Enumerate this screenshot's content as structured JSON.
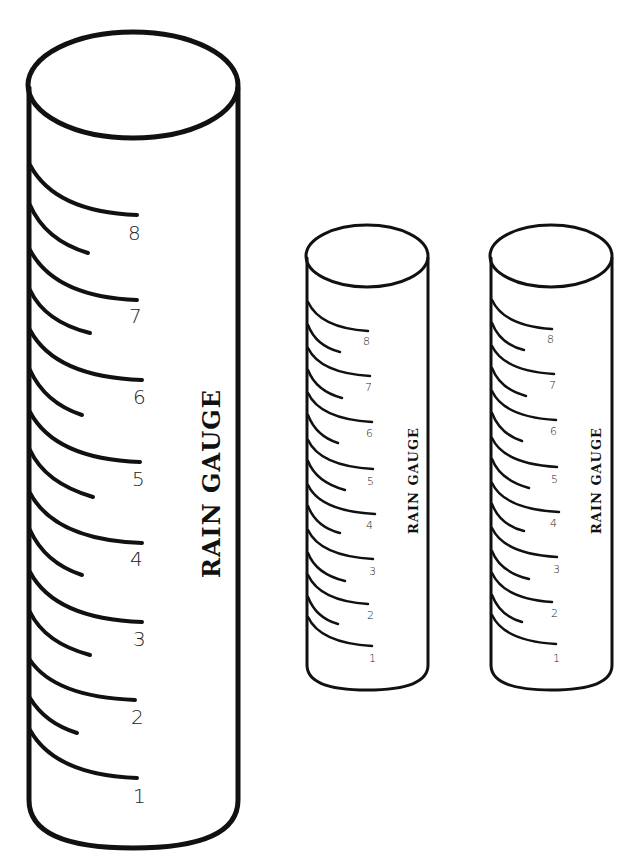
{
  "gauges": [
    {
      "id": "large",
      "label": "RAIN GAUGE",
      "marks": [
        "1",
        "2",
        "3",
        "4",
        "5",
        "6",
        "7",
        "8"
      ]
    },
    {
      "id": "small-1",
      "label": "RAIN GAUGE",
      "marks": [
        "1",
        "2",
        "3",
        "4",
        "5",
        "6",
        "7",
        "8"
      ]
    },
    {
      "id": "small-2",
      "label": "RAIN GAUGE",
      "marks": [
        "1",
        "2",
        "3",
        "4",
        "5",
        "6",
        "7",
        "8"
      ]
    }
  ]
}
